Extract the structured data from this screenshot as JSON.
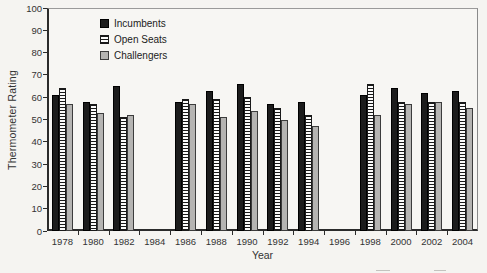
{
  "chart_data": {
    "type": "bar",
    "title": "",
    "xlabel": "Year",
    "ylabel": "Thermometer Rating",
    "ylim": [
      0,
      100
    ],
    "ytick_step": 10,
    "yticks": [
      0,
      10,
      20,
      30,
      40,
      50,
      60,
      70,
      80,
      90,
      100
    ],
    "grid": false,
    "legend_position": "top-left-inside",
    "categories": [
      "1978",
      "1980",
      "1982",
      "1984",
      "1986",
      "1988",
      "1990",
      "1992",
      "1994",
      "1996",
      "1998",
      "2000",
      "2002",
      "2004"
    ],
    "series": [
      {
        "name": "Incumbents",
        "style": "solid-black",
        "values": [
          61,
          58,
          65,
          null,
          58,
          63,
          66,
          57,
          58,
          null,
          61,
          64,
          62,
          63
        ]
      },
      {
        "name": "Open Seats",
        "style": "hatch-horizontal",
        "values": [
          64,
          57,
          51,
          null,
          59,
          59,
          60,
          55,
          52,
          null,
          66,
          58,
          58,
          58
        ]
      },
      {
        "name": "Challengers",
        "style": "solid-gray",
        "values": [
          57,
          53,
          52,
          null,
          57,
          51,
          54,
          50,
          47,
          null,
          52,
          57,
          58,
          55
        ]
      }
    ],
    "colors": {
      "incumbents_fill": "#1c1c1c",
      "open_seats_fill": "#fbfbfa",
      "open_seats_stripe": "#1a1a1a",
      "challengers_fill": "#b5b4b2",
      "axis": "#2b2b2b",
      "frame": "#9a9a9a",
      "background": "#f5f4f1",
      "text": "#2a2a2a"
    }
  }
}
